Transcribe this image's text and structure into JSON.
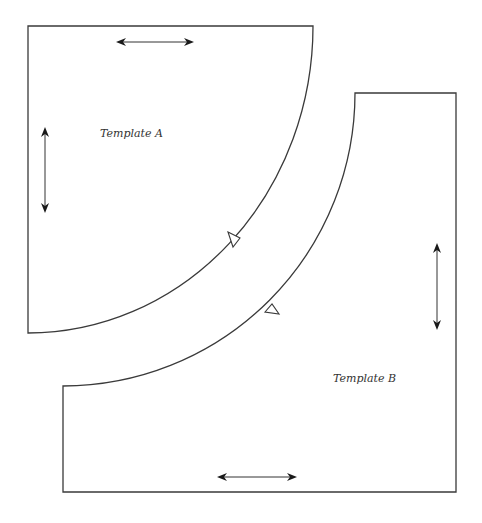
{
  "diagram": {
    "type": "quilt-pattern-templates",
    "colors": {
      "outline": "#3a3a3a",
      "arrow": "#1a1a1a",
      "background": "#ffffff"
    },
    "templates": [
      {
        "id": "A",
        "label": "Template A",
        "shape": "quarter-circle",
        "corners": {
          "top_left": [
            28,
            26
          ],
          "top_right": [
            313,
            26
          ],
          "bottom_left": [
            28,
            333
          ]
        },
        "grain_arrows": [
          {
            "orientation": "horizontal",
            "from": [
              117,
              42
            ],
            "to": [
              193,
              42
            ]
          },
          {
            "orientation": "vertical",
            "from": [
              45,
              127
            ],
            "to": [
              45,
              213
            ]
          }
        ],
        "notch": {
          "position": [
            233,
            240
          ],
          "icon": "triangle-notch-icon"
        }
      },
      {
        "id": "B",
        "label": "Template B",
        "shape": "square-minus-quarter-circle",
        "corners": {
          "top_right": [
            456,
            93
          ],
          "arc_start": [
            355,
            93
          ],
          "arc_end": [
            63,
            386
          ],
          "bottom_left": [
            63,
            492
          ],
          "bottom_right": [
            456,
            492
          ]
        },
        "grain_arrows": [
          {
            "orientation": "horizontal",
            "from": [
              217,
              477
            ],
            "to": [
              297,
              477
            ]
          },
          {
            "orientation": "vertical",
            "from": [
              437,
              243
            ],
            "to": [
              437,
              330
            ]
          }
        ],
        "notch": {
          "position": [
            270,
            310
          ],
          "icon": "triangle-notch-icon"
        }
      }
    ]
  }
}
